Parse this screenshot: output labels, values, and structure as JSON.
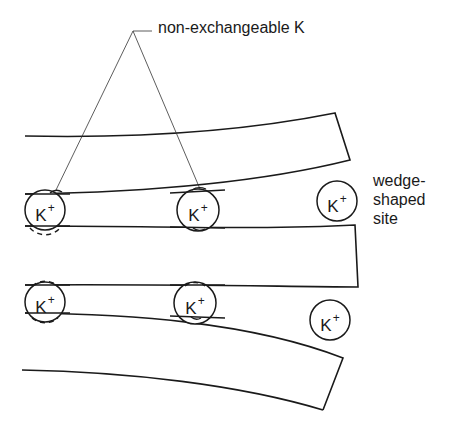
{
  "diagram": {
    "type": "clay mineral layer schematic",
    "labels": {
      "non_exchangeable": "non-exchangeable K",
      "wedge_line1": "wedge-",
      "wedge_line2": "shaped",
      "wedge_line3": "site"
    },
    "ions": [
      {
        "id": "ion-top-left",
        "symbol": "K",
        "charge": "+",
        "cx": 45,
        "cy": 210,
        "dashed_bottom": true
      },
      {
        "id": "ion-top-middle",
        "symbol": "K",
        "charge": "+",
        "cx": 198,
        "cy": 210,
        "dashed_bottom": false
      },
      {
        "id": "ion-wedge-site",
        "symbol": "K",
        "charge": "+",
        "cx": 337,
        "cy": 201,
        "dashed_bottom": false
      },
      {
        "id": "ion-bottom-left",
        "symbol": "K",
        "charge": "+",
        "cx": 45,
        "cy": 302,
        "dashed_top_bottom": true
      },
      {
        "id": "ion-bottom-middle",
        "symbol": "K",
        "charge": "+",
        "cx": 195,
        "cy": 303,
        "dashed_top": true
      },
      {
        "id": "ion-bottom-right",
        "symbol": "K",
        "charge": "+",
        "cx": 330,
        "cy": 320,
        "dashed_bottom": false
      }
    ],
    "colors": {
      "stroke": "#1a1a1a",
      "background": "#ffffff"
    }
  }
}
